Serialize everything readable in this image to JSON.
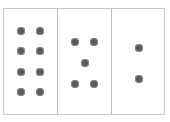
{
  "diagram": {
    "panels": [
      {
        "count": 8,
        "layout": "2 columns x 4 rows"
      },
      {
        "count": 5,
        "layout": "dice five"
      },
      {
        "count": 2,
        "layout": "vertical pair"
      }
    ],
    "dot_color": "#5a5a5a",
    "border_color": "#c8c8c8"
  }
}
